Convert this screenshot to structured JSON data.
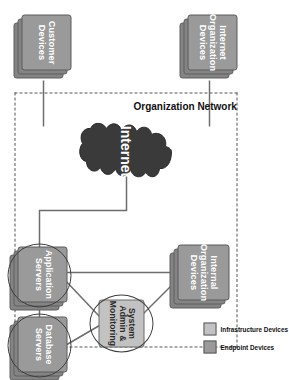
{
  "diagram": {
    "boundary_label": "Organization Network",
    "background_color": "#ffffff",
    "nodes": {
      "internet_org_devices": {
        "label": "Internet\nOrganization\nDevices",
        "label_line1": "Internet",
        "label_line2": "Organization",
        "label_line3": "Devices",
        "type": "stacked-box",
        "category": "endpoint",
        "color": "#9a9a9a",
        "inside_boundary": false
      },
      "customer_devices": {
        "label_line1": "Customer",
        "label_line2": "Devices",
        "type": "stacked-box",
        "category": "endpoint",
        "color": "#9a9a9a",
        "inside_boundary": false
      },
      "internet": {
        "label": "Internet",
        "type": "cloud",
        "color": "#3a3a3a",
        "text_color": "#ffffff",
        "inside_boundary": false
      },
      "internal_org_devices": {
        "label_line1": "Internal",
        "label_line2": "Organization",
        "label_line3": "Devices",
        "type": "stacked-box",
        "category": "endpoint",
        "color": "#9a9a9a",
        "inside_boundary": true
      },
      "system_admin": {
        "label_line1": "System",
        "label_line2": "Admin &",
        "label_line3": "Monitoring",
        "type": "box-in-ellipse",
        "category": "infrastructure",
        "color": "#c2c2c2",
        "inside_boundary": true
      },
      "application_servers": {
        "label_line1": "Application",
        "label_line2": "Servers",
        "type": "stacked-box-in-ellipse",
        "category": "infrastructure",
        "color": "#9a9a9a",
        "inside_boundary": true
      },
      "database_servers": {
        "label_line1": "Database",
        "label_line2": "Servers",
        "type": "stacked-box-in-ellipse",
        "category": "infrastructure",
        "color": "#9a9a9a",
        "inside_boundary": true
      }
    },
    "legend": {
      "items": [
        {
          "label": "Infrastructure Devices",
          "color": "#c2c2c2"
        },
        {
          "label": "Endpoint Devices",
          "color": "#9a9a9a"
        }
      ]
    },
    "connections": [
      {
        "from": "internet_org_devices",
        "to": "internet"
      },
      {
        "from": "customer_devices",
        "to": "internet"
      },
      {
        "from": "internet",
        "to": "application_servers"
      },
      {
        "from": "internal_org_devices",
        "to": "application_servers"
      },
      {
        "from": "internal_org_devices",
        "to": "system_admin"
      },
      {
        "from": "system_admin",
        "to": "application_servers"
      },
      {
        "from": "system_admin",
        "to": "database_servers"
      },
      {
        "from": "application_servers",
        "to": "database_servers"
      }
    ]
  }
}
